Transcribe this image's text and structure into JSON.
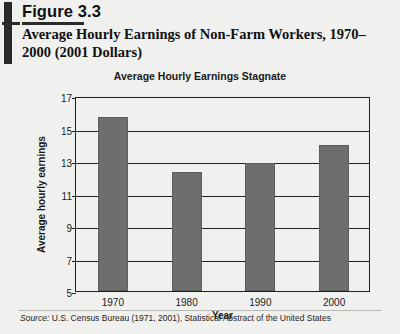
{
  "figure": {
    "number": "Figure 3.3",
    "title": "Average Hourly Earnings of Non-Farm Workers, 1970–2000 (2001 Dollars)",
    "source_prefix": "Source:",
    "source_text": " U.S. Census Bureau (1971, 2001), Statistical Abstract of the United States"
  },
  "chart_data": {
    "type": "bar",
    "title": "Average Hourly Earnings Stagnate",
    "xlabel": "Year",
    "ylabel": "Average hourly earnings",
    "categories": [
      "1970",
      "1980",
      "1990",
      "2000"
    ],
    "values": [
      15.7,
      12.3,
      12.9,
      14.0
    ],
    "ylim": [
      5,
      17
    ],
    "yticks": [
      5,
      7,
      9,
      11,
      13,
      15,
      17
    ],
    "ytick_labels": [
      "5",
      "7",
      "9",
      "11",
      "13",
      "15",
      "17"
    ],
    "grid": true,
    "legend": "none",
    "bar_color": "#6e6e6e"
  }
}
